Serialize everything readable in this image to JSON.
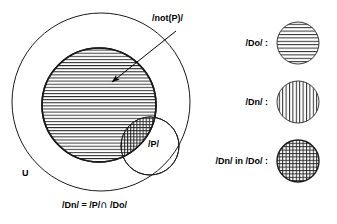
{
  "figure": {
    "type": "venn-set-diagram",
    "universe_label": "U",
    "labels": {
      "not_p": "/not(P)/",
      "p": "/P/",
      "universe": "U",
      "equation": "/Dn/ = /P/ ∩ /Do/",
      "equation_lhs": "/Dn/ = /P/",
      "equation_op": "∩",
      "equation_rhs": "/Do/"
    },
    "sets": [
      {
        "name": "universe",
        "label": "U",
        "fill": "none",
        "stroke": "#1a1a1a",
        "cx": 101,
        "cy": 102,
        "r": 89
      },
      {
        "name": "not-p",
        "label": "/not(P)/",
        "fill": "horizontal-hatch",
        "stroke": "#1a1a1a",
        "cx": 99,
        "cy": 105,
        "r": 57
      },
      {
        "name": "p",
        "label": "/P/",
        "fill": "none",
        "stroke": "#1a1a1a",
        "cx": 150,
        "cy": 146,
        "r": 29
      }
    ],
    "annotation": {
      "name": "not-p-pointer",
      "text": "/not(P)/",
      "arrow_from": [
        176,
        31
      ],
      "arrow_to": [
        108,
        85
      ]
    },
    "legend": {
      "items": [
        {
          "label": "/Do/ :",
          "pattern": "horizontal-lines",
          "cx": 298,
          "cy": 43,
          "r": 21
        },
        {
          "label": "/Dn/ :",
          "pattern": "vertical-lines",
          "cx": 298,
          "cy": 102,
          "r": 21
        },
        {
          "label": "/Dn/ in /Do/ :",
          "pattern": "crosshatch",
          "cx": 298,
          "cy": 161,
          "r": 21
        }
      ]
    },
    "colors": {
      "stroke": "#1a1a1a",
      "hatch": "#2b2b2b",
      "background": "#ffffff"
    }
  }
}
